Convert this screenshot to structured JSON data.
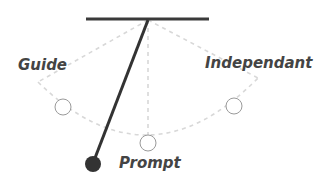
{
  "diagram": {
    "type": "pendulum",
    "labels": {
      "guide": "Guide",
      "independant": "Independant",
      "prompt": "Prompt"
    },
    "colors": {
      "bar": "#3a3a3a",
      "rod": "#333333",
      "bob": "#333333",
      "dashed": "#d8d8d8",
      "circle_outline": "#9a9a9a",
      "label_text": "#444444"
    },
    "positions": [
      {
        "name": "Guide",
        "x": 63,
        "y": 107
      },
      {
        "name": "Prompt",
        "x": 148,
        "y": 143
      },
      {
        "name": "Independant",
        "x": 234,
        "y": 106
      }
    ],
    "bob": {
      "x": 93,
      "y": 164
    }
  }
}
